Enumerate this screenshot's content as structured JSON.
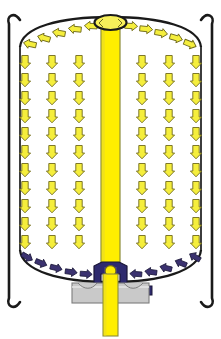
{
  "diagram": {
    "type": "process-flow-schematic",
    "canvas": {
      "width": 221,
      "height": 339
    },
    "colors": {
      "background": "#ffffff",
      "outline": "#1a1a1a",
      "flow_arrow_fill": "#f5ee3c",
      "flow_arrow_stroke": "#7a7320",
      "column_fill": "#ffee00",
      "column_edge": "#8d8d3a",
      "collector_arrow_fill": "#3b3270",
      "collector_arrow_stroke": "#1d1a3c",
      "valve_body": "#2e2a6e",
      "valve_highlight": "#4b46a0",
      "housing_fill": "#c9c9c9",
      "housing_stroke": "#7d7d7d",
      "hub_fill": "#f7f05a"
    },
    "parts": [
      {
        "id": "left-bracket",
        "label": "Left support bracket"
      },
      {
        "id": "right-bracket",
        "label": "Right support bracket"
      },
      {
        "id": "vessel-shell",
        "label": "Vessel shell"
      },
      {
        "id": "top-dome",
        "label": "Top dome head"
      },
      {
        "id": "bottom-dish",
        "label": "Bottom dished head"
      },
      {
        "id": "center-column",
        "label": "Central distributor column"
      },
      {
        "id": "top-hub",
        "label": "Top distributor hub"
      },
      {
        "id": "valve-assembly",
        "label": "Bottom valve assembly"
      },
      {
        "id": "valve-housing",
        "label": "Valve housing / flange"
      },
      {
        "id": "outlet-stem",
        "label": "Outlet stem"
      }
    ],
    "legend": {
      "downflow": "Downward bed flow (yellow arrows)",
      "distribution": "Radial distribution at top dome (yellow arrows)",
      "collection": "Inward collection at bottom dish (navy arrows)"
    },
    "counts": {
      "downflow_arrows": 66,
      "top_distribution_arrows": 14,
      "bottom_collection_arrows": 14,
      "downflow_columns": 6,
      "downflow_rows": 11
    }
  },
  "flow_field": {
    "column_x": [
      25,
      52,
      79,
      142,
      169,
      196
    ],
    "row_y": [
      62,
      80,
      98,
      116,
      134,
      152,
      170,
      188,
      206,
      224,
      242
    ],
    "arrow_width": 11,
    "arrow_height": 13
  },
  "top_arc_arrows": [
    {
      "x": 30,
      "y": 44,
      "angle": 192,
      "dir": "left"
    },
    {
      "x": 44,
      "y": 38,
      "angle": 196,
      "dir": "left"
    },
    {
      "x": 59,
      "y": 33,
      "angle": 190,
      "dir": "left"
    },
    {
      "x": 75,
      "y": 29,
      "angle": 186,
      "dir": "left"
    },
    {
      "x": 91,
      "y": 26,
      "angle": 183,
      "dir": "left"
    },
    {
      "x": 104,
      "y": 24,
      "angle": 180,
      "dir": "left"
    },
    {
      "x": 116,
      "y": 24,
      "angle": 0,
      "dir": "right"
    },
    {
      "x": 130,
      "y": 26,
      "angle": 3,
      "dir": "right"
    },
    {
      "x": 145,
      "y": 29,
      "angle": 6,
      "dir": "right"
    },
    {
      "x": 160,
      "y": 33,
      "angle": 10,
      "dir": "right"
    },
    {
      "x": 175,
      "y": 38,
      "angle": 16,
      "dir": "right"
    },
    {
      "x": 189,
      "y": 44,
      "angle": 22,
      "dir": "right"
    }
  ],
  "bottom_arc_arrows": [
    {
      "x": 27,
      "y": 257,
      "angle": 30,
      "dir": "right"
    },
    {
      "x": 40,
      "y": 263,
      "angle": 22,
      "dir": "right"
    },
    {
      "x": 55,
      "y": 268,
      "angle": 14,
      "dir": "right"
    },
    {
      "x": 70,
      "y": 272,
      "angle": 8,
      "dir": "right"
    },
    {
      "x": 85,
      "y": 274,
      "angle": 4,
      "dir": "right"
    },
    {
      "x": 136,
      "y": 274,
      "angle": 184,
      "dir": "left"
    },
    {
      "x": 151,
      "y": 272,
      "angle": 188,
      "dir": "left"
    },
    {
      "x": 166,
      "y": 268,
      "angle": 194,
      "dir": "left"
    },
    {
      "x": 181,
      "y": 263,
      "angle": 202,
      "dir": "left"
    },
    {
      "x": 194,
      "y": 257,
      "angle": 210,
      "dir": "left"
    }
  ]
}
